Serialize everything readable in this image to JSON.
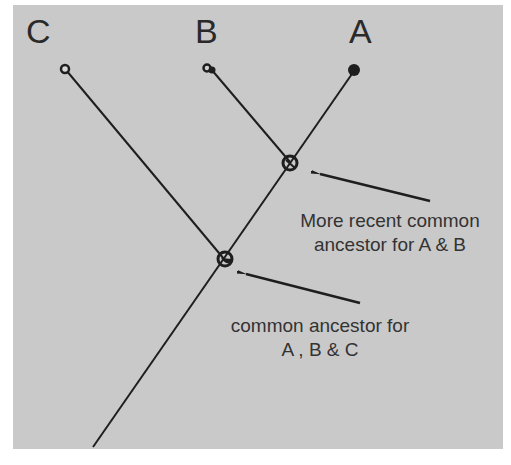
{
  "diagram": {
    "type": "phylogenetic-tree",
    "background_color": "#c9c9c9",
    "line_color": "#1e1e1e",
    "leaves": [
      {
        "id": "C",
        "label": "C"
      },
      {
        "id": "B",
        "label": "B"
      },
      {
        "id": "A",
        "label": "A"
      }
    ],
    "nodes": [
      {
        "id": "ab",
        "description": "Common ancestor of A and B"
      },
      {
        "id": "abc",
        "description": "Common ancestor of A, B and C"
      }
    ],
    "annotations": {
      "recent": {
        "line1": "More recent common",
        "line2": "ancestor for A & B"
      },
      "common": {
        "line1": "common ancestor for",
        "line2": "A , B & C"
      }
    }
  }
}
